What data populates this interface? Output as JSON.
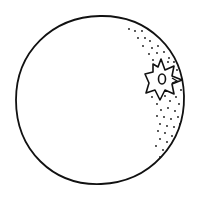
{
  "image": {
    "subject": "orange",
    "style": "black line drawing on white",
    "colors": {
      "background": "#ffffff",
      "stroke": "#111111"
    },
    "parts": [
      "fruit-outline",
      "calyx-star",
      "stem-oval",
      "peel-dots"
    ]
  }
}
